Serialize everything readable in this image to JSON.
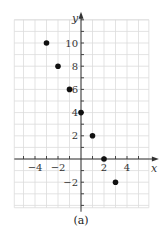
{
  "chart_data": {
    "type": "scatter",
    "title": "",
    "caption": "(a)",
    "xlabel": "x",
    "ylabel": "y",
    "xlim": [
      -5.8,
      5.9
    ],
    "ylim": [
      -4.2,
      12
    ],
    "grid": true,
    "x_ticks": [
      -4,
      -2,
      2,
      4
    ],
    "y_ticks": [
      -2,
      2,
      4,
      6,
      8,
      10
    ],
    "x_tick_labels": [
      "−4",
      "−2",
      "2",
      "4"
    ],
    "y_tick_labels": [
      "−2",
      "2",
      "4",
      "6",
      "8",
      "10"
    ],
    "series": [
      {
        "name": "points",
        "x": [
          -3,
          -2,
          -1,
          0,
          1,
          2,
          3
        ],
        "y": [
          10,
          8,
          6,
          4,
          2,
          0,
          -2
        ]
      }
    ],
    "colors": {
      "grid": "#dcdcdc",
      "axis": "#333333",
      "point": "#111111"
    }
  }
}
